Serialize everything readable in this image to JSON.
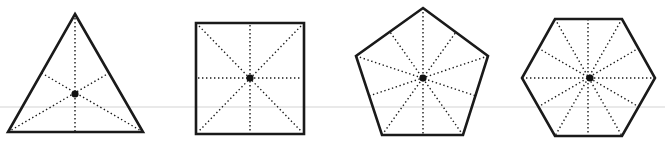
{
  "diagram": {
    "colors": {
      "outline": "#1a1a1a",
      "symmetry_lines": "#1a1a1a",
      "center": "#111111",
      "background": "#ffffff",
      "faint_rule": "#e9e9e9"
    },
    "faint_rule_y": 107,
    "shapes": [
      {
        "name": "triangle",
        "sides": 3,
        "vertices": [
          [
            75,
            14
          ],
          [
            143,
            132
          ],
          [
            8,
            132
          ]
        ],
        "center": [
          75,
          94
        ],
        "symmetry_lines": [
          [
            [
              75,
              14
            ],
            [
              75,
              132
            ]
          ],
          [
            [
              143,
              132
            ],
            [
              41.5,
              73
            ]
          ],
          [
            [
              8,
              132
            ],
            [
              109,
              73
            ]
          ]
        ]
      },
      {
        "name": "square",
        "sides": 4,
        "vertices": [
          [
            196,
            23
          ],
          [
            304,
            23
          ],
          [
            304,
            134
          ],
          [
            196,
            134
          ]
        ],
        "center": [
          250,
          78
        ],
        "symmetry_lines": [
          [
            [
              199,
              26
            ],
            [
              301,
              131
            ]
          ],
          [
            [
              301,
              26
            ],
            [
              199,
              131
            ]
          ],
          [
            [
              250,
              25
            ],
            [
              250,
              132
            ]
          ],
          [
            [
              198,
              78
            ],
            [
              302,
              78
            ]
          ]
        ]
      },
      {
        "name": "pentagon",
        "sides": 5,
        "vertices": [
          [
            423,
            8
          ],
          [
            488,
            56
          ],
          [
            463,
            135
          ],
          [
            382,
            135
          ],
          [
            356,
            56
          ]
        ],
        "center": [
          423,
          78
        ],
        "symmetry_lines": [
          [
            [
              423,
              8
            ],
            [
              423,
              135
            ]
          ],
          [
            [
              488,
              56
            ],
            [
              369,
              96
            ]
          ],
          [
            [
              463,
              135
            ],
            [
              390,
              32
            ]
          ],
          [
            [
              382,
              135
            ],
            [
              456,
              32
            ]
          ],
          [
            [
              356,
              56
            ],
            [
              476,
              96
            ]
          ]
        ]
      },
      {
        "name": "hexagon",
        "sides": 6,
        "vertices": [
          [
            555,
            19
          ],
          [
            622,
            19
          ],
          [
            655,
            78
          ],
          [
            622,
            136
          ],
          [
            555,
            136
          ],
          [
            522,
            78
          ]
        ],
        "center": [
          590,
          78
        ],
        "symmetry_lines": [
          [
            [
              555,
              19
            ],
            [
              622,
              136
            ]
          ],
          [
            [
              622,
              19
            ],
            [
              555,
              136
            ]
          ],
          [
            [
              522,
              78
            ],
            [
              655,
              78
            ]
          ],
          [
            [
              588,
              19
            ],
            [
              588,
              136
            ]
          ],
          [
            [
              538,
              48
            ],
            [
              639,
              107
            ]
          ],
          [
            [
              639,
              48
            ],
            [
              538,
              107
            ]
          ]
        ]
      }
    ]
  }
}
